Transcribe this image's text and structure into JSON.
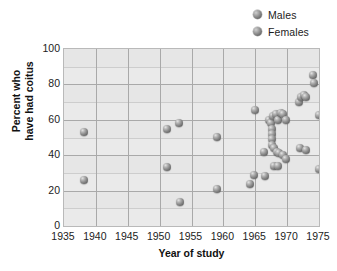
{
  "legend": {
    "position": "top-right",
    "entries": [
      {
        "label": "Males",
        "icon": "sphere-marker-icon",
        "color": "#8a8a8a"
      },
      {
        "label": "Females",
        "icon": "sphere-marker-icon",
        "color": "#8a8a8a"
      }
    ]
  },
  "axes": {
    "x": {
      "label": "Year of study",
      "ticks": [
        1935,
        1940,
        1945,
        1950,
        1955,
        1960,
        1965,
        1970,
        1975
      ],
      "min": 1935,
      "max": 1975
    },
    "y": {
      "label_line1": "Percent who",
      "label_line2": "have had coitus",
      "label": "Percent who have had coitus",
      "ticks": [
        0,
        20,
        40,
        60,
        80,
        100
      ],
      "min": 0,
      "max": 100
    }
  },
  "style": {
    "plot_background": "#e6e6e6",
    "band_color": "#eaeaea",
    "gridline_color": "#a9a9a9",
    "marker_color": "#8a8a8a",
    "text_color": "#1c1c1c"
  },
  "chart_data": {
    "type": "scatter",
    "title": "",
    "xlabel": "Year of study",
    "ylabel": "Percent who have had coitus",
    "xlim": [
      1935,
      1975
    ],
    "ylim": [
      0,
      100
    ],
    "grid": true,
    "legend_position": "top-right",
    "series": [
      {
        "name": "Males",
        "marker": "sphere",
        "color": "#8a8a8a",
        "points": [
          [
            1938.2,
            53
          ],
          [
            1951.2,
            55
          ],
          [
            1953.0,
            58
          ],
          [
            1959.0,
            50.5
          ],
          [
            1965.0,
            65.5
          ],
          [
            1967.2,
            60
          ],
          [
            1967.5,
            58
          ],
          [
            1967.8,
            62
          ],
          [
            1968.2,
            63
          ],
          [
            1968.6,
            60
          ],
          [
            1969.0,
            64
          ],
          [
            1969.4,
            63
          ],
          [
            1969.8,
            60
          ],
          [
            1967.6,
            55
          ],
          [
            1967.6,
            52
          ],
          [
            1967.6,
            49
          ],
          [
            1967.6,
            46
          ],
          [
            1968.0,
            44
          ],
          [
            1971.8,
            70
          ],
          [
            1972.2,
            73
          ],
          [
            1972.6,
            74
          ],
          [
            1973.0,
            73
          ],
          [
            1974.0,
            85.5
          ],
          [
            1974.2,
            81
          ],
          [
            1975.0,
            62.5
          ]
        ]
      },
      {
        "name": "Females",
        "marker": "sphere",
        "color": "#8a8a8a",
        "points": [
          [
            1938.2,
            26
          ],
          [
            1951.2,
            33.5
          ],
          [
            1953.2,
            13.5
          ],
          [
            1959.0,
            21
          ],
          [
            1964.2,
            24
          ],
          [
            1964.8,
            29
          ],
          [
            1966.4,
            42
          ],
          [
            1966.6,
            28
          ],
          [
            1968.4,
            42
          ],
          [
            1968.8,
            41
          ],
          [
            1969.4,
            40
          ],
          [
            1969.8,
            38
          ],
          [
            1968.0,
            34
          ],
          [
            1968.6,
            34
          ],
          [
            1972.0,
            44
          ],
          [
            1973.0,
            43
          ],
          [
            1975.0,
            32
          ]
        ]
      }
    ]
  }
}
